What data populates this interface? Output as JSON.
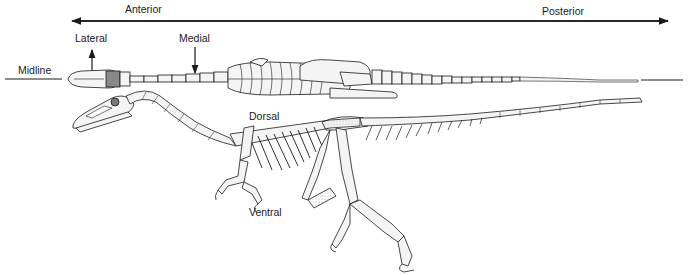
{
  "figure": {
    "views": [
      "dorsal view (top)",
      "lateral view (bottom)"
    ]
  },
  "labels": {
    "anterior": "Anterior",
    "posterior": "Posterior",
    "lateral": "Lateral",
    "medial": "Medial",
    "midline": "Midline",
    "dorsal": "Dorsal",
    "ventral": "Ventral"
  },
  "colors": {
    "ink": "#1a1a1a",
    "bone_fill": "#f4f4f4",
    "shade": "#bdbdbd",
    "background": "#ffffff"
  }
}
